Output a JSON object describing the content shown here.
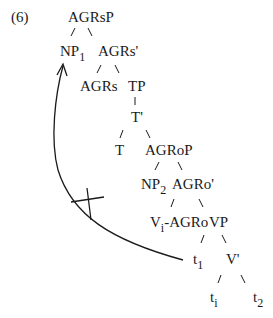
{
  "example_number": "(6)",
  "nodes": {
    "agrsp": "AGRsP",
    "np1": {
      "base": "NP",
      "sub": "1"
    },
    "agrs_bar": "AGRs'",
    "agrs": "AGRs",
    "tp": "TP",
    "t_bar": "T'",
    "t": "T",
    "agrop": "AGRoP",
    "np2": {
      "base": "NP",
      "sub": "2"
    },
    "agro_bar": "AGRo'",
    "vi_agro": {
      "base": "V",
      "sub": "i",
      "rest": "-AGRo"
    },
    "vp": "VP",
    "t1": {
      "base": "t",
      "sub": "1"
    },
    "v_bar": "V'",
    "ti": {
      "base": "t",
      "sub": "i"
    },
    "t2": {
      "base": "t",
      "sub": "2"
    }
  },
  "annotations": {
    "movement_arrow": "movement from t1 to NP1",
    "cross_mark": "blocked movement"
  },
  "colors": {
    "ink": "#1a1a1a",
    "background": "#ffffff"
  }
}
